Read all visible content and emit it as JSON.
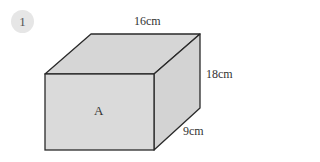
{
  "question": {
    "number": "1"
  },
  "cuboid": {
    "face_label": "A",
    "length_label": "16cm",
    "height_label": "18cm",
    "depth_label": "9cm",
    "dimensions": {
      "length_cm": 16,
      "height_cm": 18,
      "depth_cm": 9
    },
    "colors": {
      "face": "#d9d9d9",
      "top": "#d3d3d3",
      "side": "#cfcfcf",
      "edge": "#2a2a2a"
    }
  }
}
